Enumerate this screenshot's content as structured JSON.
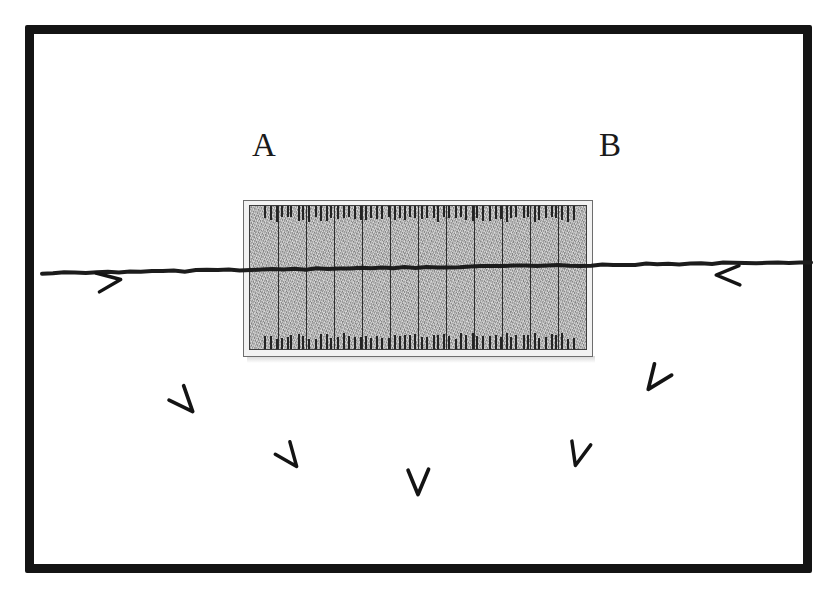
{
  "figure": {
    "background_color": "#ffffff",
    "ink_color": "#141414"
  },
  "frame": {
    "name": "outer-border",
    "color": "#141414",
    "thickness_px": 9,
    "x": 25,
    "y": 25,
    "width": 787,
    "height": 548
  },
  "labels": [
    {
      "id": "a",
      "text": "A",
      "x": 252,
      "y": 129
    },
    {
      "id": "b",
      "text": "B",
      "x": 599,
      "y": 129
    }
  ],
  "scale_bar": {
    "name": "graduated-scale-rectangle",
    "outer": {
      "x": 243,
      "y": 200,
      "width": 350,
      "height": 157
    },
    "inner": {
      "x": 249,
      "y": 205,
      "width": 338,
      "height": 145
    },
    "fill_color": "#a9a9a9",
    "border_color": "#3d3d3d",
    "column_count": 12,
    "divider_positions_pct": [
      8.3,
      16.6,
      25.0,
      33.3,
      41.6,
      50.0,
      58.3,
      66.6,
      75.0,
      83.3,
      91.6
    ],
    "tick_color": "#242424",
    "tick_length_px": 14,
    "tick_count_per_edge": 56,
    "tick_edge_inset_pct": 4
  },
  "ink_line": {
    "name": "slanted-reference-line",
    "color": "#1c1c1c",
    "stroke_width": 4,
    "start": {
      "x": 42,
      "y": 273
    },
    "end": {
      "x": 811,
      "y": 262
    },
    "description": "long nearly-horizontal line sloping slightly upward to the right, passing through the scale bar"
  },
  "chevron_marks": [
    {
      "id": "mark-left-under-line",
      "glyph": "<",
      "x": 110,
      "y": 281,
      "rotation": -8,
      "size": 30
    },
    {
      "id": "mark-right-under-line",
      "glyph": ">",
      "x": 727,
      "y": 275,
      "rotation": 0,
      "size": 30
    },
    {
      "id": "mark-lower-left",
      "glyph": "v",
      "x": 185,
      "y": 403,
      "rotation": -42,
      "size": 32
    },
    {
      "id": "mark-lower-left-2",
      "glyph": "v",
      "x": 290,
      "y": 458,
      "rotation": -38,
      "size": 30
    },
    {
      "id": "mark-bottom-center",
      "glyph": "v",
      "x": 418,
      "y": 483,
      "rotation": 0,
      "size": 32
    },
    {
      "id": "mark-lower-right-2",
      "glyph": "v",
      "x": 578,
      "y": 455,
      "rotation": 14,
      "size": 30
    },
    {
      "id": "mark-lower-right",
      "glyph": "v",
      "x": 655,
      "y": 380,
      "rotation": 36,
      "size": 32
    }
  ]
}
